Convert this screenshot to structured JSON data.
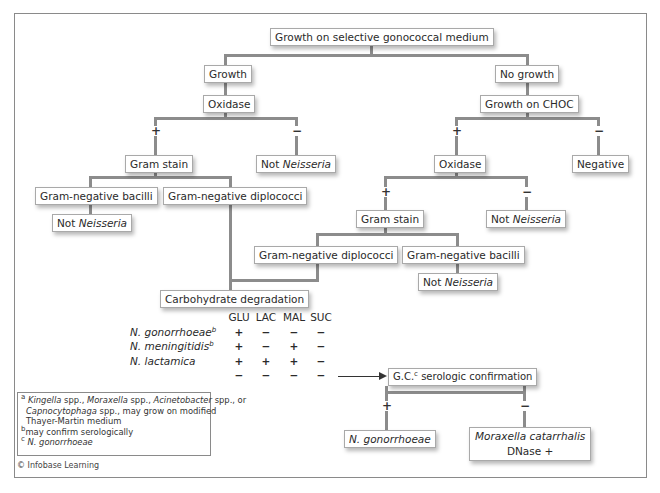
{
  "diagram": {
    "title_node": "Growth on selective gonococcal medium",
    "nodes": {
      "growth": "Growth",
      "no_growth": "No growth",
      "oxidase_left": "Oxidase",
      "growth_on_choc": "Growth on CHOC",
      "gram_stain_left": "Gram stain",
      "not_neisseria_1_prefix": "Not ",
      "not_neisseria_1_italic": "Neisseria",
      "oxidase_right": "Oxidase",
      "negative": "Negative",
      "gram_neg_bacilli_left": "Gram-negative bacilli",
      "gram_neg_diplococci_left": "Gram-negative diplococci",
      "not_neisseria_2_prefix": "Not ",
      "not_neisseria_2_italic": "Neisseria",
      "gram_stain_right": "Gram stain",
      "not_neisseria_3_prefix": "Not ",
      "not_neisseria_3_italic": "Neisseria",
      "gram_neg_diplococci_right": "Gram-negative diplococci",
      "gram_neg_bacilli_right": "Gram-negative bacilli",
      "not_neisseria_4_prefix": "Not ",
      "not_neisseria_4_italic": "Neisseria",
      "carbohydrate": "Carbohydrate degradation",
      "gc_prefix": "G.C.",
      "gc_sup": "c",
      "gc_suffix": " serologic confirmation",
      "n_gonorrhoeae_result": "N. gonorrhoeae",
      "moraxella": "Moraxella catarrhalis",
      "dnase": "DNase +"
    },
    "signs": {
      "plus": "+",
      "minus": "−"
    },
    "carbohydrate_table": {
      "columns": [
        "GLU",
        "LAC",
        "MAL",
        "SUC"
      ],
      "rows": [
        {
          "name": "N. gonorrhoeae",
          "sup": "b",
          "values": [
            "+",
            "−",
            "−",
            "−"
          ]
        },
        {
          "name": "N. meningitidis",
          "sup": "b",
          "values": [
            "+",
            "−",
            "+",
            "−"
          ]
        },
        {
          "name": "N. lactamica",
          "sup": "",
          "values": [
            "+",
            "+",
            "+",
            "−"
          ]
        },
        {
          "name": "",
          "sup": "",
          "values": [
            "−",
            "−",
            "−",
            "−"
          ]
        }
      ]
    },
    "footnotes": {
      "a_mark": "a",
      "a_kingella": "Kingella",
      "a_t1": " spp., ",
      "a_moraxella": "Moraxella",
      "a_t2": " spp., ",
      "a_acinetobacter": "Acinetobacter",
      "a_t3": " spp., or",
      "a_capno": "Capnocytophaga",
      "a_t4": " spp., may grow on modified",
      "a_line3": "Thayer-Martin medium",
      "b_mark": "b",
      "b_text": "may confirm serologically",
      "c_mark": "c",
      "c_text": "N. gonorrhoeae"
    },
    "copyright": "© Infobase Learning"
  }
}
